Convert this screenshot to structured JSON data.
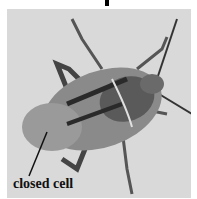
{
  "figure": {
    "annotation": {
      "label": "closed cell"
    },
    "colors": {
      "background": "#d9d9d9",
      "insect_dark": "#2a2a2a",
      "insect_mid": "#7a7a7a",
      "text": "#111111"
    }
  }
}
